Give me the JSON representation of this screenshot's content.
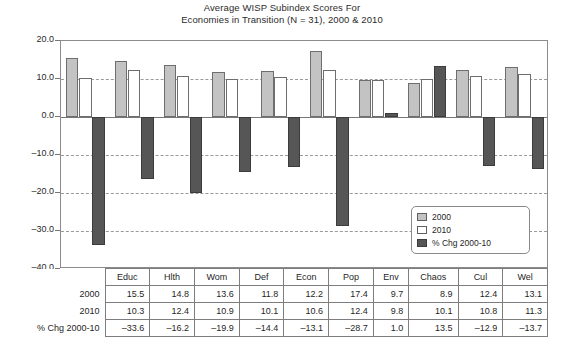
{
  "chart_data": {
    "type": "bar",
    "title": "Average WISP Subindex Scores For\nEconomies in Transition (N = 31), 2000 & 2010",
    "title_line1": "Average WISP Subindex Scores For",
    "title_line2": "Economies in Transition (N = 31), 2000 & 2010",
    "xlabel": "",
    "ylabel": "",
    "ylim": [
      -40.0,
      20.0
    ],
    "ytick_labels": [
      "20.0",
      "10.0",
      "0.0",
      "–10.0",
      "–20.0",
      "–30.0",
      "–40.0"
    ],
    "ytick_values": [
      20.0,
      10.0,
      0.0,
      -10.0,
      -20.0,
      -30.0,
      -40.0
    ],
    "grid": true,
    "legend_position": "lower-right-inside",
    "categories": [
      "Educ",
      "Hlth",
      "Wom",
      "Def",
      "Econ",
      "Pop",
      "Env",
      "Chaos",
      "Cul",
      "Wel"
    ],
    "series": [
      {
        "name": "2000",
        "color": "#c3c3c3",
        "values": [
          15.5,
          14.8,
          13.6,
          11.8,
          12.2,
          17.4,
          9.7,
          8.9,
          12.4,
          13.1
        ]
      },
      {
        "name": "2010",
        "color": "#ffffff",
        "values": [
          10.3,
          12.4,
          10.9,
          10.1,
          10.6,
          12.4,
          9.8,
          10.1,
          10.8,
          11.3
        ]
      },
      {
        "name": "% Chg 2000-10",
        "color": "#565656",
        "values": [
          -33.6,
          -16.2,
          -19.9,
          -14.4,
          -13.1,
          -28.7,
          1.0,
          13.5,
          -12.9,
          -13.7
        ]
      }
    ]
  },
  "legend": {
    "entries": [
      {
        "label": "2000",
        "swatch": "sw-2000"
      },
      {
        "label": "2010",
        "swatch": "sw-2010"
      },
      {
        "label": "% Chg 2000-10",
        "swatch": "sw-chg"
      }
    ]
  },
  "table": {
    "column_headers": [
      "Educ",
      "Hlth",
      "Wom",
      "Def",
      "Econ",
      "Pop",
      "Env",
      "Chaos",
      "Cul",
      "Wel"
    ],
    "rows": [
      {
        "label": "2000",
        "cells": [
          "15.5",
          "14.8",
          "13.6",
          "11.8",
          "12.2",
          "17.4",
          "9.7",
          "8.9",
          "12.4",
          "13.1"
        ]
      },
      {
        "label": "2010",
        "cells": [
          "10.3",
          "12.4",
          "10.9",
          "10.1",
          "10.6",
          "12.4",
          "9.8",
          "10.1",
          "10.8",
          "11.3"
        ]
      },
      {
        "label": "% Chg 2000-10",
        "cells": [
          "–33.6",
          "–16.2",
          "–19.9",
          "–14.4",
          "–13.1",
          "–28.7",
          "1.0",
          "13.5",
          "–12.9",
          "–13.7"
        ]
      }
    ]
  },
  "colors": {
    "series_2000": "#c3c3c3",
    "series_2010": "#ffffff",
    "series_chg": "#565656",
    "axis": "#8b8b8b",
    "grid": "#9a9a9a",
    "text": "#1f1f1f"
  }
}
